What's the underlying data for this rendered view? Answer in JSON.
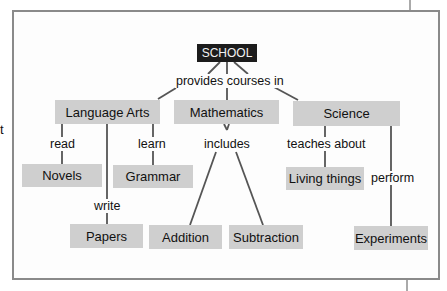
{
  "diagram": {
    "root": {
      "id": "school",
      "label": "SCHOOL"
    },
    "nodes": {
      "language_arts": "Language Arts",
      "mathematics": "Mathematics",
      "science": "Science",
      "novels": "Novels",
      "grammar": "Grammar",
      "papers": "Papers",
      "addition": "Addition",
      "subtraction": "Subtraction",
      "living_things": "Living things",
      "experiments": "Experiments"
    },
    "link_labels": {
      "provides_courses_in": "provides courses in",
      "read": "read",
      "write": "write",
      "learn": "learn",
      "includes": "includes",
      "teaches_about": "teaches about",
      "perform": "perform"
    },
    "edges": [
      {
        "from": "SCHOOL",
        "label": "provides courses in",
        "to": [
          "Language Arts",
          "Mathematics",
          "Science"
        ]
      },
      {
        "from": "Language Arts",
        "label": "read",
        "to": "Novels"
      },
      {
        "from": "Language Arts",
        "label": "write",
        "to": "Papers"
      },
      {
        "from": "Language Arts",
        "label": "learn",
        "to": "Grammar"
      },
      {
        "from": "Mathematics",
        "label": "includes",
        "to": [
          "Addition",
          "Subtraction"
        ]
      },
      {
        "from": "Science",
        "label": "teaches about",
        "to": "Living things"
      },
      {
        "from": "Science",
        "label": "perform",
        "to": "Experiments"
      }
    ],
    "stray_text": "t",
    "colors": {
      "node_bg": "#cfcfcf",
      "root_bg": "#1c1c1c",
      "root_text": "#f2f2f2",
      "line": "#555555",
      "frame": "#8a8a8a"
    }
  }
}
